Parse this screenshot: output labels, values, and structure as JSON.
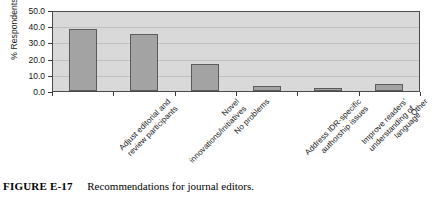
{
  "caption": {
    "id": "FIGURE E-17",
    "text": "Recommendations for journal editors."
  },
  "chart_data": {
    "type": "bar",
    "title": "",
    "xlabel": "",
    "ylabel": "% Respondents",
    "categories": [
      "Adjust editorial and\nreview participants",
      "Novel\ninnovations/initiatives",
      "No problems",
      "Address IDR-specific\nauthorship issues",
      "Improve readers'\nunderstanding of\nlanguage",
      "Other"
    ],
    "values": [
      38.8,
      36.0,
      17.5,
      4.0,
      2.5,
      5.0
    ],
    "ylim": [
      0.0,
      50.0
    ],
    "yticks": [
      0.0,
      10.0,
      20.0,
      30.0,
      40.0,
      50.0
    ],
    "ytick_labels": [
      "0.0",
      "10.0",
      "20.0",
      "30.0",
      "40.0",
      "50.0"
    ],
    "grid": true,
    "legend": "none",
    "bar_color": "#a3a3a3",
    "bar_edge_color": "#5b5b5b",
    "plot_background": "#d9d9d9"
  }
}
